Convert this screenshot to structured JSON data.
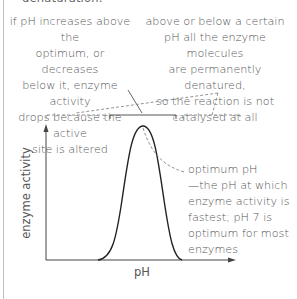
{
  "diagram": {
    "title_fragment": "denaturation.",
    "annotations": {
      "left": "if pH increases above the optimum, or decreases below it, enzyme activity drops because the active site is altered",
      "right": "above or below a certain pH all the enzyme molecules are permanently denatured, so the reaction is not catalysed at all",
      "optimum": "optimum pH —the pH at which enzyme activity is fastest; pH 7 is optimum for most enzymes"
    },
    "left_lines": [
      "if pH increases above the",
      "optimum, or decreases",
      "below it, enzyme activity",
      "drops because the active",
      "site is altered"
    ],
    "right_lines": [
      "above or below a certain",
      "pH all the enzyme molecules",
      "are permanently denatured,",
      "so the reaction is not",
      "catalysed at all"
    ],
    "optimum_lines": [
      "optimum pH",
      "—the pH at which",
      "enzyme activity is",
      "fastest; pH 7 is",
      "optimum for most",
      "enzymes"
    ],
    "axes": {
      "x_label": "pH",
      "y_label": "enzyme activity"
    },
    "curve": {
      "type": "bell",
      "description": "enzyme activity peaks at optimum pH and falls to zero on either side"
    },
    "colors": {
      "line": "#222222",
      "dashed": "#888888",
      "text": "#555555",
      "border": "#bdbdbd"
    }
  }
}
